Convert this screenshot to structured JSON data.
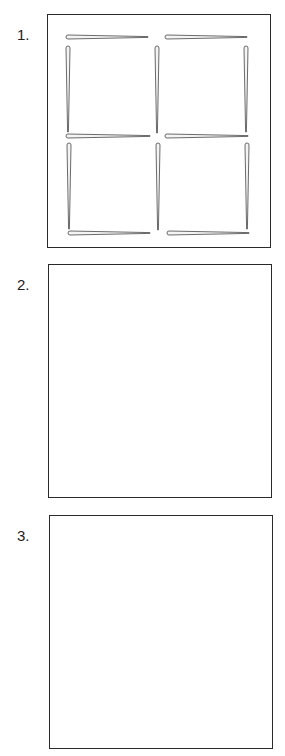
{
  "puzzle": {
    "panels": [
      {
        "label": "1.",
        "box": {
          "x": 47,
          "y": 14,
          "w": 224,
          "h": 234
        },
        "label_pos": {
          "x": 17,
          "y": 26
        },
        "sticks": [
          {
            "orient": "h",
            "x1": 66,
            "y": 37,
            "x2": 148
          },
          {
            "orient": "h",
            "x1": 165,
            "y": 37,
            "x2": 247
          },
          {
            "orient": "h",
            "x1": 66,
            "y": 136,
            "x2": 150
          },
          {
            "orient": "h",
            "x1": 165,
            "y": 136,
            "x2": 248
          },
          {
            "orient": "h",
            "x1": 68,
            "y": 233,
            "x2": 150
          },
          {
            "orient": "h",
            "x1": 167,
            "y": 233,
            "x2": 249
          },
          {
            "orient": "v",
            "x": 68,
            "y1": 46,
            "y2": 132
          },
          {
            "orient": "v",
            "x": 157,
            "y1": 46,
            "y2": 133
          },
          {
            "orient": "v",
            "x": 246,
            "y1": 46,
            "y2": 132
          },
          {
            "orient": "v",
            "x": 69,
            "y1": 143,
            "y2": 229
          },
          {
            "orient": "v",
            "x": 158,
            "y1": 143,
            "y2": 230
          },
          {
            "orient": "v",
            "x": 247,
            "y1": 143,
            "y2": 229
          }
        ]
      },
      {
        "label": "2.",
        "box": {
          "x": 48,
          "y": 264,
          "w": 224,
          "h": 234
        },
        "label_pos": {
          "x": 17,
          "y": 276
        },
        "sticks": []
      },
      {
        "label": "3.",
        "box": {
          "x": 49,
          "y": 515,
          "w": 224,
          "h": 234
        },
        "label_pos": {
          "x": 17,
          "y": 527
        },
        "sticks": []
      }
    ],
    "colors": {
      "box_border": "#2a2a2a",
      "stick_outline": "#5a5a5a",
      "stick_fill": "#f4f4f4",
      "label": "#222222"
    }
  }
}
